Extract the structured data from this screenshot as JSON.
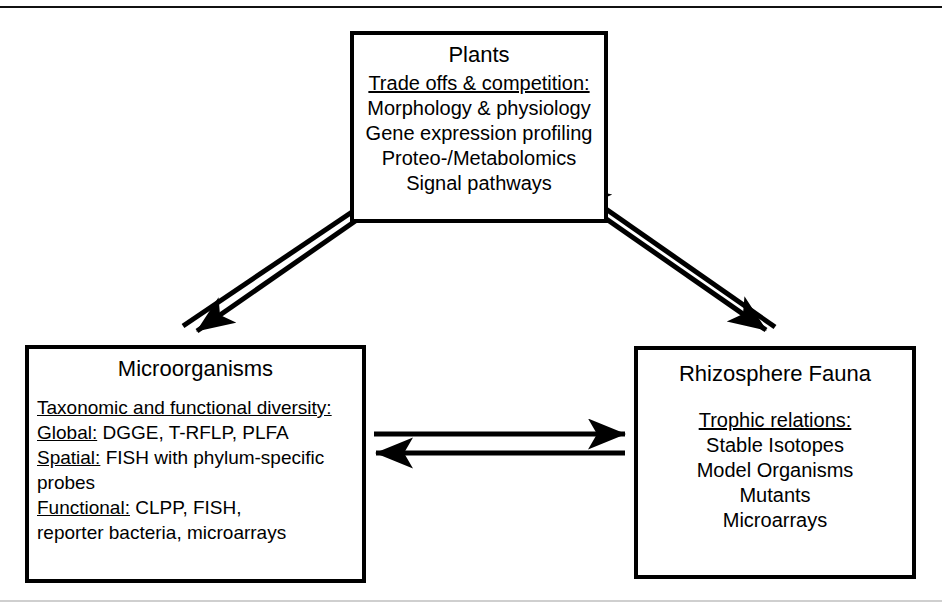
{
  "diagram": {
    "type": "flow-diagram",
    "ink_color": "#000000",
    "background_color": "#ffffff",
    "nodes": [
      {
        "id": "plants",
        "title": "Plants",
        "heading": "Trade offs & competition:",
        "items": [
          "Morphology & physiology",
          "Gene expression profiling",
          "Proteo-/Metabolomics",
          "Signal pathways"
        ]
      },
      {
        "id": "microorganisms",
        "title": "Microorganisms",
        "heading": "Taxonomic and functional diversity:",
        "lines": [
          {
            "label": "Global:",
            "text": " DGGE, T-RFLP, PLFA"
          },
          {
            "label": "Spatial:",
            "text": " FISH with phylum-specific"
          },
          {
            "label": "",
            "text": "probes"
          },
          {
            "label": "Functional:",
            "text": " CLPP, FISH,"
          },
          {
            "label": "",
            "text": "reporter bacteria, microarrays"
          }
        ]
      },
      {
        "id": "fauna",
        "title": "Rhizosphere Fauna",
        "heading": "Trophic relations:",
        "items": [
          "Stable Isotopes",
          "Model Organisms",
          "Mutants",
          "Microarrays"
        ]
      }
    ],
    "edges": [
      {
        "id": "micro-to-plants",
        "from": "microorganisms",
        "to": "plants",
        "style": "single-line-arrow"
      },
      {
        "id": "plants-to-micro",
        "from": "plants",
        "to": "microorganisms",
        "style": "single-line-arrow"
      },
      {
        "id": "fauna-to-plants",
        "from": "fauna",
        "to": "plants",
        "style": "single-line-arrow"
      },
      {
        "id": "plants-to-fauna",
        "from": "plants",
        "to": "fauna",
        "style": "single-line-arrow"
      },
      {
        "id": "micro-to-fauna",
        "from": "microorganisms",
        "to": "fauna",
        "style": "single-line-arrow"
      },
      {
        "id": "fauna-to-micro",
        "from": "fauna",
        "to": "microorganisms",
        "style": "single-line-arrow"
      }
    ]
  }
}
